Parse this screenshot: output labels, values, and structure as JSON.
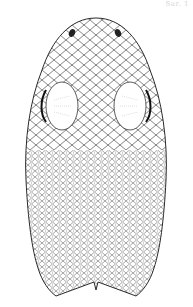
{
  "figure": {
    "caption": "Sar. 1",
    "colors": {
      "ink": "#2a2a2a",
      "background": "#ffffff",
      "stipple": "#9a9a9a"
    }
  }
}
